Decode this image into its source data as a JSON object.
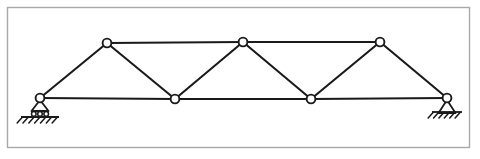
{
  "figure": {
    "type": "engineering-line-diagram",
    "canvas": {
      "width": 480,
      "height": 159,
      "background": "#ffffff"
    },
    "frame": {
      "name": "figure-border",
      "x": 7.5,
      "y": 7.5,
      "width": 462,
      "height": 140,
      "stroke": "#a8a8a8",
      "stroke_width": 1.4,
      "fill": "none"
    },
    "style": {
      "member_stroke": "#1a1a1a",
      "member_width": 2.1,
      "node_fill": "#ffffff",
      "node_stroke": "#1a1a1a",
      "node_stroke_width": 1.9,
      "node_radius": 4.4,
      "support_stroke": "#1a1a1a",
      "support_width": 1.8,
      "hatch_stroke": "#1a1a1a",
      "hatch_width": 1.5
    },
    "nodes": [
      {
        "id": "L0",
        "label": "left-support-node",
        "x": 40,
        "y": 98,
        "chord": "bottom"
      },
      {
        "id": "L1",
        "label": "bottom-node-1",
        "x": 175,
        "y": 99,
        "chord": "bottom"
      },
      {
        "id": "L2",
        "label": "bottom-node-2",
        "x": 311,
        "y": 99,
        "chord": "bottom"
      },
      {
        "id": "L3",
        "label": "right-support-node",
        "x": 447,
        "y": 98,
        "chord": "bottom"
      },
      {
        "id": "U0",
        "label": "top-node-1",
        "x": 107,
        "y": 43,
        "chord": "top"
      },
      {
        "id": "U1",
        "label": "top-node-2",
        "x": 243,
        "y": 42,
        "chord": "top"
      },
      {
        "id": "U2",
        "label": "top-node-3",
        "x": 380,
        "y": 42,
        "chord": "top"
      }
    ],
    "members": [
      {
        "id": "m1",
        "label": "bottom-chord-L0-L1",
        "from": "L0",
        "to": "L1",
        "kind": "bottom-chord"
      },
      {
        "id": "m2",
        "label": "bottom-chord-L1-L2",
        "from": "L1",
        "to": "L2",
        "kind": "bottom-chord"
      },
      {
        "id": "m3",
        "label": "bottom-chord-L2-L3",
        "from": "L2",
        "to": "L3",
        "kind": "bottom-chord"
      },
      {
        "id": "m4",
        "label": "top-chord-U0-U1",
        "from": "U0",
        "to": "U1",
        "kind": "top-chord"
      },
      {
        "id": "m5",
        "label": "top-chord-U1-U2",
        "from": "U1",
        "to": "U2",
        "kind": "top-chord"
      },
      {
        "id": "m6",
        "label": "diagonal-L0-U0",
        "from": "L0",
        "to": "U0",
        "kind": "diagonal"
      },
      {
        "id": "m7",
        "label": "diagonal-U0-L1",
        "from": "U0",
        "to": "L1",
        "kind": "diagonal"
      },
      {
        "id": "m8",
        "label": "diagonal-L1-U1",
        "from": "L1",
        "to": "U1",
        "kind": "diagonal"
      },
      {
        "id": "m9",
        "label": "diagonal-U1-L2",
        "from": "U1",
        "to": "L2",
        "kind": "diagonal"
      },
      {
        "id": "m10",
        "label": "diagonal-L2-U2",
        "from": "L2",
        "to": "U2",
        "kind": "diagonal"
      },
      {
        "id": "m11",
        "label": "diagonal-U2-L3",
        "from": "U2",
        "to": "L3",
        "kind": "diagonal"
      }
    ],
    "supports": [
      {
        "id": "sup-left",
        "label": "roller-support",
        "type": "roller",
        "at_node": "L0",
        "x": 40,
        "y": 98,
        "triangle_half_width": 8.5,
        "triangle_height": 11,
        "roller_count": 3,
        "roller_radius": 2.3,
        "ground_y": 117,
        "ground_half_width": 19,
        "hatch_count": 7,
        "hatch_length": 8,
        "hatch_angle_deg": 48
      },
      {
        "id": "sup-right",
        "label": "pinned-support",
        "type": "pinned",
        "at_node": "L3",
        "x": 447,
        "y": 98,
        "triangle_half_width": 8.5,
        "triangle_height": 13,
        "roller_count": 0,
        "roller_radius": 0,
        "ground_y": 112,
        "ground_half_width": 15,
        "hatch_count": 6,
        "hatch_length": 8,
        "hatch_angle_deg": 48
      }
    ]
  }
}
